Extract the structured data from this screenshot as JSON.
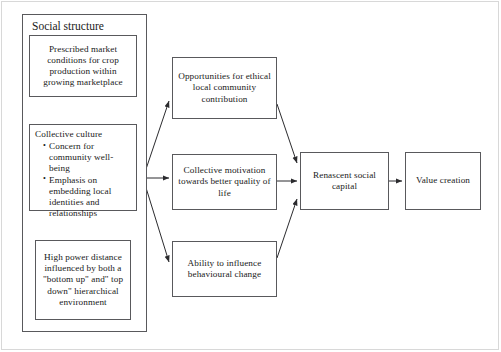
{
  "diagram": {
    "title_group": "Social structure",
    "nodes": {
      "prescribed": "Prescribed market conditions for crop production within growing marketplace",
      "collective_culture_title": "Collective culture",
      "collective_culture_bullets": [
        "Concern for community well-being",
        "Emphasis on embedding local identities and relationships"
      ],
      "high_power": "High power distance influenced by both a \"bottom up\" and\" top down\" hierarchical environment",
      "opportunities": "Opportunities for ethical local community contribution",
      "motivation": "Collective motivation towards better quality of  life",
      "ability": "Ability to influence behavioural change",
      "renascent": "Renascent social capital",
      "value_creation": "Value creation"
    },
    "colors": {
      "stroke": "#59595c",
      "text": "#1a1a1a",
      "background": "#ffffff",
      "frame": "#d8d8d8"
    }
  }
}
